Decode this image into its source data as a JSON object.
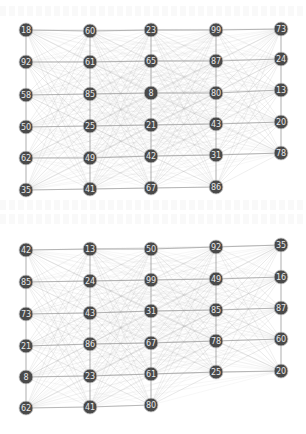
{
  "diagram": {
    "type": "layered-graph",
    "style": {
      "background": "#ffffff",
      "node_fill": "#4a4a4a",
      "node_stroke": "#cfcfcf",
      "node_text": "#e8e8e8",
      "edge_color": "#b8b8b8",
      "grid_edge_color": "#9a9a9a",
      "node_radius": 7
    },
    "graphs": [
      {
        "name": "top-graph",
        "columns": [
          {
            "x": 26,
            "nodes": [
              {
                "label": "18",
                "y": 30
              },
              {
                "label": "92",
                "y": 62
              },
              {
                "label": "58",
                "y": 95
              },
              {
                "label": "50",
                "y": 127
              },
              {
                "label": "62",
                "y": 158
              },
              {
                "label": "35",
                "y": 190
              }
            ]
          },
          {
            "x": 90,
            "nodes": [
              {
                "label": "60",
                "y": 31
              },
              {
                "label": "61",
                "y": 62
              },
              {
                "label": "85",
                "y": 94
              },
              {
                "label": "25",
                "y": 126
              },
              {
                "label": "49",
                "y": 158
              },
              {
                "label": "41",
                "y": 189
              }
            ]
          },
          {
            "x": 151,
            "nodes": [
              {
                "label": "23",
                "y": 30
              },
              {
                "label": "65",
                "y": 61
              },
              {
                "label": "8",
                "y": 93
              },
              {
                "label": "21",
                "y": 125
              },
              {
                "label": "42",
                "y": 156
              },
              {
                "label": "67",
                "y": 188
              }
            ]
          },
          {
            "x": 216,
            "nodes": [
              {
                "label": "99",
                "y": 30
              },
              {
                "label": "87",
                "y": 61
              },
              {
                "label": "80",
                "y": 93
              },
              {
                "label": "43",
                "y": 124
              },
              {
                "label": "31",
                "y": 155
              },
              {
                "label": "86",
                "y": 187
              }
            ]
          },
          {
            "x": 281,
            "nodes": [
              {
                "label": "73",
                "y": 29
              },
              {
                "label": "24",
                "y": 59
              },
              {
                "label": "13",
                "y": 90
              },
              {
                "label": "20",
                "y": 122
              },
              {
                "label": "78",
                "y": 153
              }
            ]
          }
        ]
      },
      {
        "name": "bottom-graph",
        "columns": [
          {
            "x": 26,
            "nodes": [
              {
                "label": "42",
                "y": 250
              },
              {
                "label": "85",
                "y": 282
              },
              {
                "label": "73",
                "y": 314
              },
              {
                "label": "21",
                "y": 346
              },
              {
                "label": "8",
                "y": 377
              },
              {
                "label": "62",
                "y": 408
              }
            ]
          },
          {
            "x": 90,
            "nodes": [
              {
                "label": "13",
                "y": 249
              },
              {
                "label": "24",
                "y": 281
              },
              {
                "label": "43",
                "y": 313
              },
              {
                "label": "86",
                "y": 344
              },
              {
                "label": "23",
                "y": 376
              },
              {
                "label": "41",
                "y": 407
              }
            ]
          },
          {
            "x": 151,
            "nodes": [
              {
                "label": "50",
                "y": 249
              },
              {
                "label": "99",
                "y": 280
              },
              {
                "label": "31",
                "y": 311
              },
              {
                "label": "67",
                "y": 343
              },
              {
                "label": "61",
                "y": 374
              },
              {
                "label": "80",
                "y": 405
              }
            ]
          },
          {
            "x": 216,
            "nodes": [
              {
                "label": "92",
                "y": 247
              },
              {
                "label": "49",
                "y": 279
              },
              {
                "label": "85",
                "y": 310
              },
              {
                "label": "78",
                "y": 341
              },
              {
                "label": "25",
                "y": 372
              }
            ]
          },
          {
            "x": 281,
            "nodes": [
              {
                "label": "35",
                "y": 245
              },
              {
                "label": "16",
                "y": 277
              },
              {
                "label": "87",
                "y": 308
              },
              {
                "label": "60",
                "y": 339
              },
              {
                "label": "20",
                "y": 371
              }
            ]
          }
        ]
      }
    ]
  }
}
